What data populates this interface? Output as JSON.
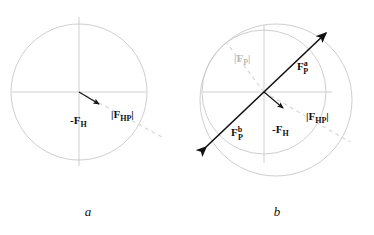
{
  "figure": {
    "background_color": "#ffffff",
    "panels": [
      {
        "id": "a",
        "caption": "a",
        "center": {
          "x": 79,
          "y": 92
        },
        "circles": [
          {
            "name": "hip-circle",
            "cx": 79,
            "cy": 92,
            "r": 68,
            "stroke": "#c8c8c8"
          }
        ],
        "axes": {
          "horizontal": {
            "x1": 12,
            "y1": 92,
            "x2": 146,
            "y2": 92,
            "stroke": "#c4c4c4"
          },
          "vertical": {
            "x1": 79,
            "y1": 17,
            "x2": 79,
            "y2": 166,
            "stroke": "#c4c4c4"
          }
        },
        "dashed_line": {
          "name": "fhp-direction",
          "x1": 79,
          "y1": 92,
          "x2": 160,
          "y2": 136,
          "stroke": "#d5d5d5"
        },
        "vectors": [
          {
            "name": "minus-FH",
            "label_main": "-F",
            "label_sub": "H",
            "label_sup": "",
            "color": "#111111",
            "x1": 79,
            "y1": 92,
            "x2": 101,
            "y2": 105,
            "label_x": 74,
            "label_y": 121
          }
        ],
        "labels": [
          {
            "name": "FHP-magnitude",
            "text_open": "|F",
            "text_sub": "HP",
            "text_close": "|",
            "color": "#111111",
            "x": 113,
            "y": 116
          }
        ]
      },
      {
        "id": "b",
        "caption": "b",
        "center": {
          "x": 264,
          "y": 92
        },
        "circles": [
          {
            "name": "inner-hip-circle",
            "cx": 264,
            "cy": 92,
            "r": 62,
            "stroke": "#c8c8c8"
          },
          {
            "name": "outer-shifted-circle",
            "cx": 276,
            "cy": 100,
            "r": 76,
            "stroke": "#c8c8c8"
          }
        ],
        "axes": {
          "horizontal": {
            "x1": 203,
            "y1": 92,
            "x2": 332,
            "y2": 92,
            "stroke": "#c4c4c4"
          },
          "vertical": {
            "x1": 264,
            "y1": 25,
            "x2": 264,
            "y2": 162,
            "stroke": "#c4c4c4"
          }
        },
        "dashed_lines": [
          {
            "name": "fp-magnitude-dashed",
            "x1": 264,
            "y1": 92,
            "x2": 228,
            "y2": 44,
            "stroke": "#d5d5d5"
          },
          {
            "name": "fhp-direction-dashed",
            "x1": 264,
            "y1": 92,
            "x2": 348,
            "y2": 140,
            "stroke": "#d5d5d5"
          }
        ],
        "vectors": [
          {
            "name": "FP-a",
            "label_main": "F",
            "label_sub": "P",
            "label_sup": "a",
            "color": "#111111",
            "x1": 264,
            "y1": 92,
            "x2": 327,
            "y2": 32,
            "label_x": 300,
            "label_y": 72
          },
          {
            "name": "FP-b",
            "label_main": "F",
            "label_sub": "P",
            "label_sup": "b",
            "color": "#111111",
            "x1": 264,
            "y1": 92,
            "x2": 205,
            "y2": 148,
            "label_x": 234,
            "label_y": 139
          },
          {
            "name": "minus-FH",
            "label_main": "-F",
            "label_sub": "H",
            "label_sup": "",
            "color": "#111111",
            "x1": 264,
            "y1": 92,
            "x2": 285,
            "y2": 110,
            "label_x": 276,
            "label_y": 132
          }
        ],
        "labels": [
          {
            "name": "FP-magnitude",
            "text_open": "|F",
            "text_sub": "P",
            "text_close": "|",
            "color": "#b9b9b9",
            "x": 236,
            "y": 60
          },
          {
            "name": "FHP-magnitude",
            "text_open": "|F",
            "text_sub": "HP",
            "text_close": "|",
            "color": "#111111",
            "x": 310,
            "y": 118
          }
        ]
      }
    ]
  },
  "panel_a": {
    "caption": "a",
    "minus_fh": {
      "main": "-F",
      "sub": "H"
    },
    "fhp": {
      "open": "|F",
      "sub": "HP",
      "close": "|"
    }
  },
  "panel_b": {
    "caption": "b",
    "fp_a": {
      "main": "F",
      "sub": "P",
      "sup": "a"
    },
    "fp_b": {
      "main": "F",
      "sub": "P",
      "sup": "b"
    },
    "minus_fh": {
      "main": "-F",
      "sub": "H"
    },
    "fp_mag": {
      "open": "|F",
      "sub": "P",
      "close": "|"
    },
    "fhp_mag": {
      "open": "|F",
      "sub": "HP",
      "close": "|"
    }
  },
  "colors": {
    "ink": "#111111",
    "circle_stroke": "#c8c8c8",
    "axis_stroke": "#c4c4c4",
    "dashed_stroke": "#d5d5d5",
    "gray_label": "#b9b9b9",
    "background": "#ffffff"
  }
}
